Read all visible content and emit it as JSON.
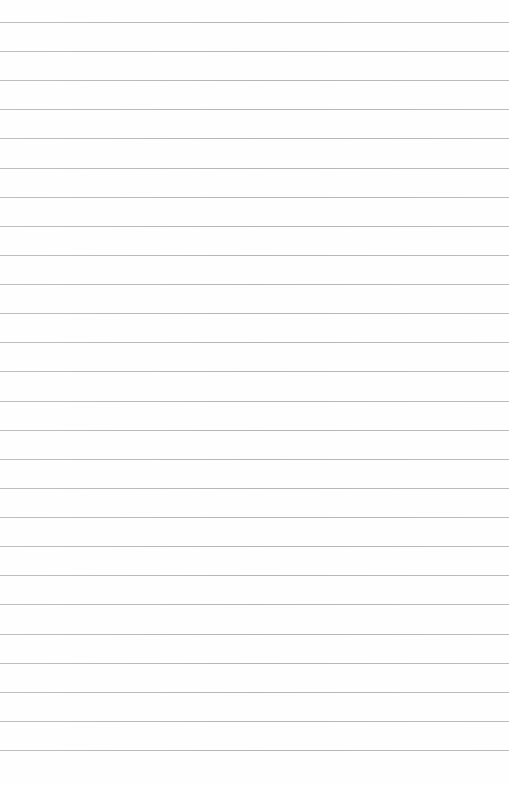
{
  "page": {
    "type": "lined-paper",
    "background_color": "#fefefe",
    "line_color": "#acacac",
    "line_count": 26,
    "first_line_y": 22,
    "line_spacing": 29.12,
    "content_text": ""
  }
}
